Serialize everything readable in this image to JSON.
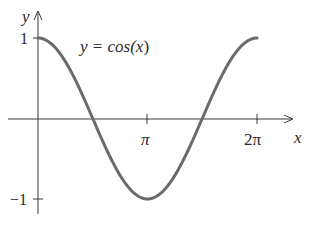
{
  "chart_data": {
    "type": "line",
    "title": "",
    "annotation": "y = cos(x)",
    "xlabel": "x",
    "ylabel": "y",
    "x_ticks": [
      {
        "value": 3.14159,
        "label": "π"
      },
      {
        "value": 6.28319,
        "label": "2π"
      }
    ],
    "y_ticks": [
      {
        "value": 1,
        "label": "1"
      },
      {
        "value": -1,
        "label": "-1"
      }
    ],
    "xlim": [
      -0.6,
      7.0
    ],
    "ylim": [
      -1.3,
      1.2
    ],
    "grid": false,
    "legend": "none",
    "series": [
      {
        "name": "cos(x)",
        "x": [
          0,
          0.7854,
          1.5708,
          2.3562,
          3.1416,
          3.927,
          4.7124,
          5.4978,
          6.2832
        ],
        "values": [
          1,
          0.7071,
          0,
          -0.7071,
          -1,
          -0.7071,
          0,
          0.7071,
          1
        ],
        "color": "#6b6b6b"
      }
    ]
  },
  "labels": {
    "y_axis": "y",
    "x_axis": "x",
    "equation_prefix": "y = cos(",
    "equation_var": "x",
    "equation_suffix": ")",
    "tick_one": "1",
    "tick_neg_one": "−1",
    "tick_pi": "π",
    "tick_two_pi": "2π"
  }
}
